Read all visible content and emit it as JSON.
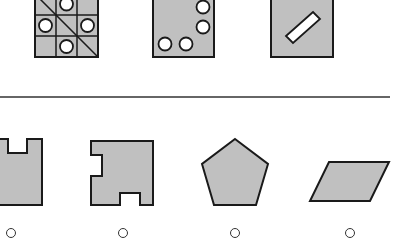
{
  "puzzle": {
    "fill_color": "#c0c0c0",
    "stroke_color": "#1a1a1a",
    "question_row": [
      {
        "name": "grid-with-circles",
        "description": "3x3 grid with diagonal line and four circles"
      },
      {
        "name": "rectangle-with-four-circles",
        "description": "rectangle with circles along right and bottom"
      },
      {
        "name": "rectangle-with-bar",
        "description": "rectangle with tilted white bar"
      }
    ],
    "options": [
      {
        "id": "A",
        "shape": "notched-square"
      },
      {
        "id": "B",
        "shape": "notched-polygon"
      },
      {
        "id": "C",
        "shape": "pentagon"
      },
      {
        "id": "D",
        "shape": "parallelogram"
      }
    ]
  }
}
